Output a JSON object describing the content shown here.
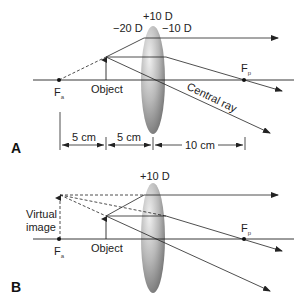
{
  "panel_a": {
    "letter": "A",
    "lens_power": "+10 D",
    "vergence_left": "−20 D",
    "vergence_right": "−10 D",
    "focal_anterior": "F",
    "focal_anterior_sub": "a",
    "focal_posterior": "F",
    "focal_posterior_sub": "p",
    "object_label": "Object",
    "central_ray_label": "Central ray",
    "dimensions": [
      "5 cm",
      "5 cm",
      "10 cm"
    ]
  },
  "panel_b": {
    "letter": "B",
    "lens_power": "+10 D",
    "focal_anterior": "F",
    "focal_anterior_sub": "a",
    "focal_posterior": "F",
    "focal_posterior_sub": "p",
    "object_label": "Object",
    "virtual_image_line1": "Virtual",
    "virtual_image_line2": "image"
  },
  "colors": {
    "line": "#222222",
    "lens_light": "#e6e6e6",
    "lens_dark": "#7a7a7a"
  }
}
